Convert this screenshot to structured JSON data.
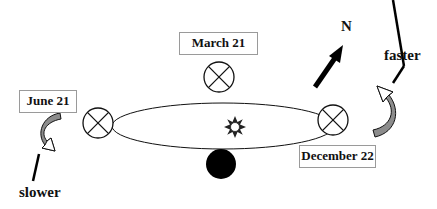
{
  "labels": {
    "march": "March 21",
    "june": "June 21",
    "december": "December 22",
    "north": "N",
    "faster": "faster",
    "slower": "slower"
  },
  "colors": {
    "stroke": "#111111",
    "arrow_fill": "#8c8c8c",
    "box_border": "#9a9a9a",
    "earth_dark": "#000000"
  }
}
